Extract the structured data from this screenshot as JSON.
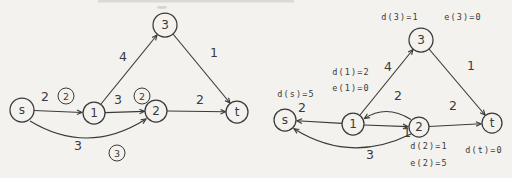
{
  "colors": {
    "ink": "#3a3a3a",
    "paper": "#f3f2ee"
  },
  "left": {
    "nodes": {
      "s": "s",
      "n1": "1",
      "n2": "2",
      "n3": "3",
      "t": "t"
    },
    "edges": {
      "s_to_1": "2",
      "one_to_3": "4",
      "three_to_t": "1",
      "one_to_2": "3",
      "two_to_t": "2",
      "s_to_2": "3"
    },
    "circled": {
      "on_s1": "2",
      "on_12": "2",
      "on_s2": "3"
    }
  },
  "right": {
    "nodes": {
      "s": "s",
      "n1": "1",
      "n2": "2",
      "n3": "3",
      "t": "t"
    },
    "edges": {
      "one_to_s": "2",
      "one_to_3": "4",
      "three_to_t": "1",
      "one_to_2": "1",
      "two_to_1": "2",
      "two_to_t": "2",
      "two_to_s": "3"
    },
    "annotations": {
      "d3": "d(3)=1",
      "e3": "e(3)=0",
      "d1": "d(1)=2",
      "e1": "e(1)=0",
      "ds": "d(s)=5",
      "d2": "d(2)=1",
      "e2": "e(2)=5",
      "dt": "d(t)=0"
    }
  }
}
